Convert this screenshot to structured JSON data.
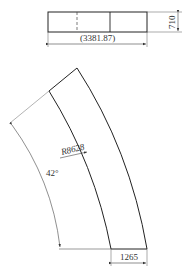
{
  "drawing": {
    "top_view": {
      "length_label": "(3381.87)",
      "height_label": "710"
    },
    "arc_view": {
      "radius_label": "R8628",
      "angle_label": "42°",
      "width_label": "1265"
    }
  }
}
